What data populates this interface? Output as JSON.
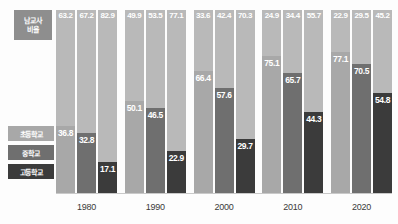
{
  "corner": {
    "line1": "남교사",
    "line2": "비율"
  },
  "legend": {
    "items": [
      {
        "label": "초등학교",
        "color": "#a8a8a8"
      },
      {
        "label": "중학교",
        "color": "#6f6f6f"
      },
      {
        "label": "고등학교",
        "color": "#3b3b3b"
      }
    ]
  },
  "chart_data": {
    "type": "bar",
    "title": "남교사 비율",
    "xlabel": "",
    "ylabel": "",
    "stacked": true,
    "ylim": [
      0,
      100
    ],
    "grid": false,
    "legend_position": "left",
    "categories": [
      "1980",
      "1990",
      "2000",
      "2010",
      "2020"
    ],
    "subcategories": [
      "초등학교",
      "중학교",
      "고등학교"
    ],
    "series": [
      {
        "name": "여교사 비율",
        "values": [
          [
            63.2,
            67.2,
            82.9
          ],
          [
            49.9,
            53.5,
            77.1
          ],
          [
            33.6,
            42.4,
            70.3
          ],
          [
            24.9,
            34.4,
            55.7
          ],
          [
            22.9,
            29.5,
            45.2
          ]
        ]
      },
      {
        "name": "남교사 비율",
        "values": [
          [
            36.8,
            32.8,
            17.1
          ],
          [
            50.1,
            46.5,
            22.9
          ],
          [
            66.4,
            57.6,
            29.7
          ],
          [
            75.1,
            65.7,
            44.3
          ],
          [
            77.1,
            70.5,
            54.8
          ]
        ]
      }
    ],
    "colors": {
      "top_segment": "#b9b9b9",
      "elementary": "#a8a8a8",
      "middle": "#6f6f6f",
      "high": "#3b3b3b"
    }
  },
  "axis": {
    "labels": [
      "1980",
      "1990",
      "2000",
      "2010",
      "2020"
    ]
  }
}
